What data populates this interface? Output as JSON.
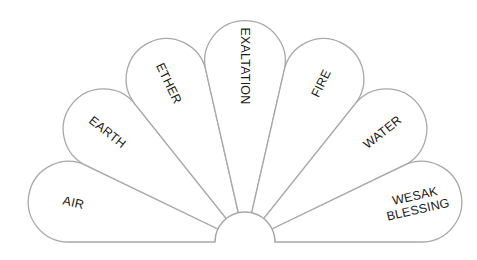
{
  "diagram": {
    "type": "fan",
    "colors": {
      "stroke": "#a8a8a8",
      "fill": "#ffffff",
      "text": "#1a1a1a"
    },
    "petals": [
      {
        "id": "air",
        "label": "AIR"
      },
      {
        "id": "earth",
        "label": "EARTH"
      },
      {
        "id": "ether",
        "label": "ETHER"
      },
      {
        "id": "exaltation",
        "label": "EXALTATION"
      },
      {
        "id": "fire",
        "label": "FIRE"
      },
      {
        "id": "water",
        "label": "WATER"
      },
      {
        "id": "wesak",
        "label": "WESAK BLESSING",
        "lines": [
          "WESAK",
          "BLESSING"
        ]
      }
    ]
  }
}
